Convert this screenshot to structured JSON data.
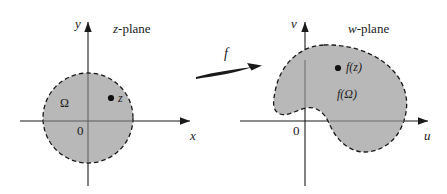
{
  "figure": {
    "background_color": "#ffffff",
    "region_fill_color": "#b8b8b8",
    "boundary_color": "#1a1a1a",
    "axis_color": "#1a1a1a"
  },
  "z_plane": {
    "plane_label_var": "z",
    "plane_label_suffix": "-plane",
    "x_axis_label": "x",
    "y_axis_label": "y",
    "origin_label": "0",
    "region_label": "Ω",
    "point_label": "z",
    "region_shape": "disk",
    "boundary_style": "dashed"
  },
  "w_plane": {
    "plane_label_var": "w",
    "plane_label_suffix": "-plane",
    "x_axis_label": "u",
    "y_axis_label": "v",
    "origin_label": "0",
    "region_label": "f(Ω)",
    "point_label": "f(z)",
    "region_shape": "bean",
    "boundary_style": "dashed"
  },
  "mapping": {
    "arrow_label": "f",
    "direction": "left-to-right"
  }
}
